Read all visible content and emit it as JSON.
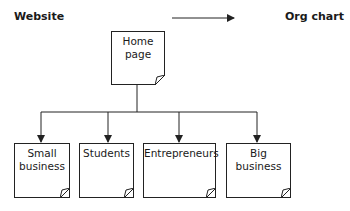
{
  "header": {
    "left_label": "Website",
    "right_label": "Org chart"
  },
  "root": {
    "label_line1": "Home",
    "label_line2": "page"
  },
  "children": [
    {
      "label_line1": "Small",
      "label_line2": "business"
    },
    {
      "label_line1": "Students",
      "label_line2": ""
    },
    {
      "label_line1": "Entrepreneurs",
      "label_line2": ""
    },
    {
      "label_line1": "Big business",
      "label_line2": ""
    }
  ],
  "colors": {
    "stroke": "#222222",
    "background": "#ffffff"
  }
}
